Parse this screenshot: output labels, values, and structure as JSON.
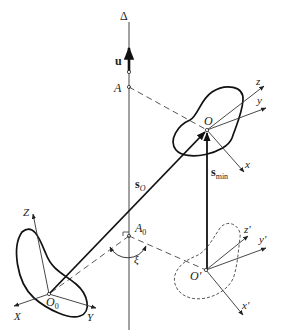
{
  "diagram": {
    "type": "kinematics-screw-axis",
    "labels": {
      "axis": "Δ",
      "unit_vector": "u",
      "point_A": "A",
      "point_A0": "A",
      "point_A0_sub": "0",
      "angle": "ξ",
      "origin_O": "O",
      "origin_O_prime": "O'",
      "origin_O0": "O",
      "origin_O0_sub": "0",
      "vec_sO": "s",
      "vec_sO_sub": "O",
      "vec_smin": "s",
      "vec_smin_sub": "min",
      "frame_O": {
        "x": "x",
        "y": "y",
        "z": "z"
      },
      "frame_O_prime": {
        "x": "x'",
        "y": "y'",
        "z": "z'"
      },
      "frame_O0": {
        "x": "X",
        "y": "Y",
        "z": "Z"
      }
    },
    "colors": {
      "stroke": "#222222",
      "light_stroke": "#555555",
      "background": "#ffffff"
    }
  }
}
